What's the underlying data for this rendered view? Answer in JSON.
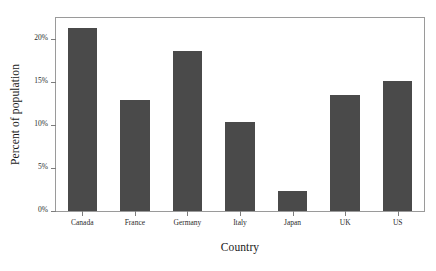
{
  "chart_data": {
    "type": "bar",
    "title": "",
    "xlabel": "Country",
    "ylabel": "Percent of population",
    "categories": [
      "Canada",
      "France",
      "Germany",
      "Italy",
      "Japan",
      "UK",
      "US"
    ],
    "values": [
      21.3,
      12.9,
      18.6,
      10.4,
      2.3,
      13.5,
      15.1
    ],
    "ylim": [
      0,
      22.5
    ],
    "yticks": [
      0,
      5,
      10,
      15,
      20
    ],
    "ytick_labels": [
      "0%",
      "5%",
      "10%",
      "15%",
      "20%"
    ],
    "grid": false,
    "legend": null,
    "bar_color": "#4a4a4a",
    "frame_color": "#9a9a9a"
  },
  "caption": {
    "text": ""
  }
}
